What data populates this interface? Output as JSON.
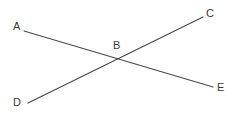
{
  "figure": {
    "background_color": "#ffffff",
    "stroke_color": "#4a4a4a",
    "stroke_width": 1.2,
    "width": 238,
    "height": 117
  },
  "labels": {
    "A": "A",
    "B": "B",
    "C": "C",
    "D": "D",
    "E": "E"
  },
  "chart_data": {
    "type": "scatter",
    "xlabel": "",
    "ylabel": "",
    "grid": false,
    "legend": "none",
    "xlim": [
      0,
      238
    ],
    "ylim": [
      117,
      0
    ],
    "points": [
      {
        "name": "A",
        "x": 24,
        "y": 31
      },
      {
        "name": "B",
        "x": 120,
        "y": 58
      },
      {
        "name": "C",
        "x": 203,
        "y": 17
      },
      {
        "name": "D",
        "x": 28,
        "y": 103
      },
      {
        "name": "E",
        "x": 213,
        "y": 87
      }
    ],
    "segments": [
      {
        "name": "AE",
        "from": "A",
        "to": "E",
        "x1": 24,
        "y1": 31,
        "x2": 213,
        "y2": 87
      },
      {
        "name": "DC",
        "from": "D",
        "to": "C",
        "x1": 28,
        "y1": 103,
        "x2": 203,
        "y2": 17
      }
    ],
    "annotations": [
      {
        "text": "A",
        "x": 17,
        "y": 26
      },
      {
        "text": "B",
        "x": 117,
        "y": 45
      },
      {
        "text": "C",
        "x": 210,
        "y": 13
      },
      {
        "text": "D",
        "x": 17,
        "y": 102
      },
      {
        "text": "E",
        "x": 221,
        "y": 87
      }
    ]
  }
}
